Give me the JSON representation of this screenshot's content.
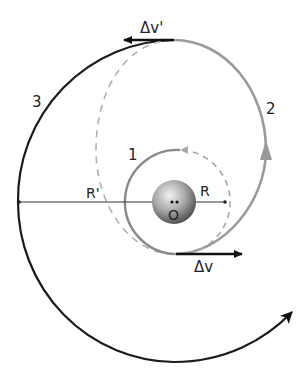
{
  "diagram": {
    "labels": {
      "orbit_1": "1",
      "orbit_2": "2",
      "orbit_3": "3",
      "inner_radius": "R",
      "outer_radius": "R'",
      "center": "O",
      "delta_v_first": "Δv",
      "delta_v_second": "Δv'"
    },
    "colors": {
      "outer_orbit": "#1a1a1a",
      "transfer_orbit": "#9a9a9a",
      "inner_orbit": "#8a8a8a",
      "dashed": "#b0b0b0",
      "arrow": "#111111",
      "planet_light": "#e8e8e8",
      "planet_dark": "#6a6a6a"
    }
  }
}
